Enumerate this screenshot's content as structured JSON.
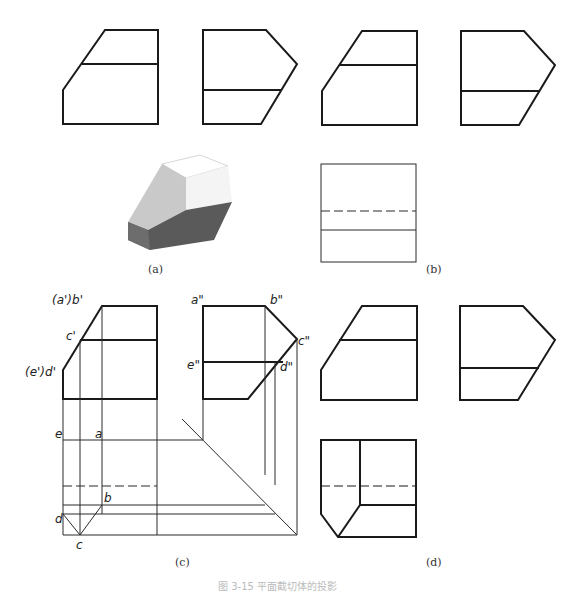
{
  "figure": {
    "caption": "图 3-15 平面截切体的投影",
    "panels": [
      {
        "id": "a",
        "label": "(a)",
        "content": "front view, side view and shaded isometric solid"
      },
      {
        "id": "b",
        "label": "(b)",
        "content": "front view, side view and top view with hidden line"
      },
      {
        "id": "c",
        "label": "(c)",
        "content": "construction with projection lines and 45-degree miter line"
      },
      {
        "id": "d",
        "label": "(d)",
        "content": "completed three views"
      }
    ],
    "point_labels": {
      "front": [
        "(a')b'",
        "c'",
        "(e')d'"
      ],
      "side": [
        "a\"",
        "b\"",
        "c\"",
        "e\"",
        "d\""
      ],
      "top": [
        "e",
        "a",
        "b",
        "d",
        "c"
      ]
    },
    "colors": {
      "line": "#1a1a1a",
      "solid_top": "#ffffff",
      "solid_left": "#c9c9c9",
      "solid_right": "#f4f4f4",
      "solid_bottom": "#5a5a5a"
    }
  }
}
